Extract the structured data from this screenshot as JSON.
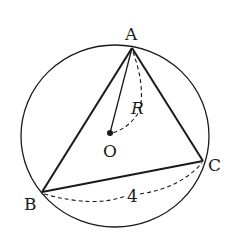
{
  "diagram": {
    "type": "geometry",
    "circle": {
      "center_label": "O",
      "radius_label": "R"
    },
    "vertices": [
      {
        "label": "A"
      },
      {
        "label": "B"
      },
      {
        "label": "C"
      }
    ],
    "measurements": {
      "bc_length": "4"
    },
    "colors": {
      "stroke": "#1a1a1a",
      "background": "#ffffff"
    }
  }
}
